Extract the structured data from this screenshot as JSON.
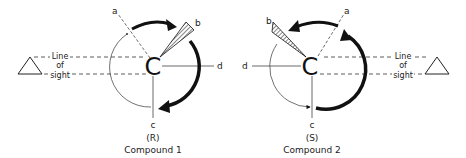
{
  "figure": {
    "compounds": [
      {
        "id": "compound-1",
        "center_label": "C",
        "substituents": {
          "a": "a",
          "b": "b",
          "c": "c",
          "d": "d"
        },
        "line_of_sight": [
          "Line",
          "of",
          "sight"
        ],
        "configuration": "(R)",
        "caption": "Compound 1",
        "rotation": "clockwise"
      },
      {
        "id": "compound-2",
        "center_label": "C",
        "substituents": {
          "a": "a",
          "b": "b",
          "c": "c",
          "d": "d"
        },
        "line_of_sight": [
          "Line",
          "of",
          "sight"
        ],
        "configuration": "(S)",
        "caption": "Compound 2",
        "rotation": "counterclockwise"
      }
    ],
    "colors": {
      "ink": "#111111",
      "background": "#ffffff"
    }
  }
}
